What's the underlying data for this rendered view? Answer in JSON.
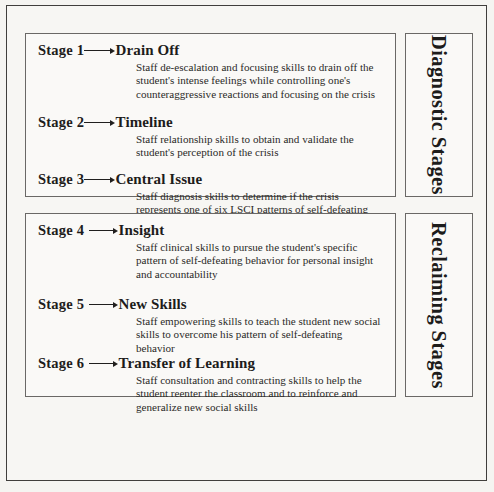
{
  "diagram": {
    "type": "process-stages",
    "groups": [
      {
        "id": "diagnostic",
        "label": "Diagnostic Stages",
        "stages": [
          {
            "number": "Stage 1",
            "title": "Drain Off",
            "description": "Staff de-escalation and focusing skills to drain off the student's intense feelings while controlling one's counteraggressive reactions and focusing on the crisis"
          },
          {
            "number": "Stage 2",
            "title": "Timeline",
            "description": "Staff relationship skills to obtain and validate the student's perception of the crisis"
          },
          {
            "number": "Stage 3",
            "title": "Central Issue",
            "description": "Staff diagnosis skills to determine if the crisis represents one of six LSCI patterns of self-defeating behavior"
          }
        ]
      },
      {
        "id": "reclaiming",
        "label": "Reclaiming Stages",
        "stages": [
          {
            "number": "Stage 4",
            "title": "Insight",
            "description": "Staff clinical skills to pursue the student's specific pattern of self-defeating behavior for personal insight and accountability"
          },
          {
            "number": "Stage 5",
            "title": "New Skills",
            "description": "Staff empowering skills to teach the student new social skills to overcome his pattern of self-defeating behavior"
          },
          {
            "number": "Stage 6",
            "title": "Transfer of Learning",
            "description": "Staff consultation and contracting skills to help the student reenter the classroom and to reinforce and generalize new social skills"
          }
        ]
      }
    ]
  }
}
